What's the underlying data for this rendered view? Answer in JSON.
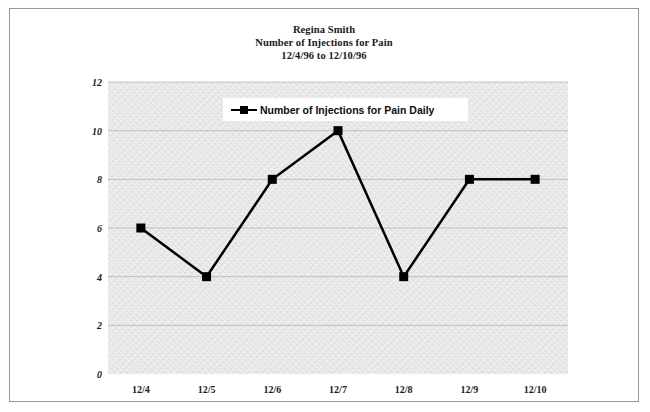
{
  "frame": {
    "border_color": "#9a9a9a"
  },
  "title": {
    "line1": "Regina Smith",
    "line2": "Number of Injections for Pain",
    "line3": "12/4/96 to 12/10/96"
  },
  "legend": {
    "label": "Number of Injections for Pain Daily",
    "marker": "filled-square",
    "position": "inside-top-center"
  },
  "chart_data": {
    "type": "line",
    "categories": [
      "12/4",
      "12/5",
      "12/6",
      "12/7",
      "12/8",
      "12/9",
      "12/10"
    ],
    "series": [
      {
        "name": "Number of Injections for Pain Daily",
        "values": [
          6,
          4,
          8,
          10,
          4,
          8,
          8
        ],
        "color": "#000000",
        "marker": "square",
        "line_width": 2.5
      }
    ],
    "xlabel": "",
    "ylabel": "",
    "ylim": [
      0,
      12
    ],
    "yticks": [
      0,
      2,
      4,
      6,
      8,
      10,
      12
    ],
    "ytick_labels": [
      "0",
      "2",
      "4",
      "6",
      "8",
      "10",
      "12"
    ],
    "grid": {
      "horizontal": true,
      "vertical": false,
      "color": "#b4b4b4"
    },
    "plot_background": "#d8d8d8",
    "legend_position": "top-center"
  }
}
